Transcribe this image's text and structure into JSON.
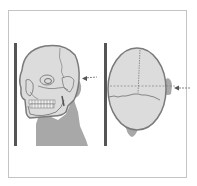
{
  "figure": {
    "panels": [
      {
        "id": "lateral",
        "label": "Lateral skull against image receptor",
        "central_ray": "horizontal, entering from right"
      },
      {
        "id": "superior",
        "label": "Superior view of head against image receptor",
        "central_ray": "horizontal, entering from right"
      }
    ],
    "colors": {
      "frame": "#c4c4c4",
      "receptor": "#555555",
      "skull_fill": "#dcdcdc",
      "skull_outline": "#7a7a7a",
      "soft_tissue": "#a8a8a8",
      "lines": "#6e6e6e"
    }
  }
}
